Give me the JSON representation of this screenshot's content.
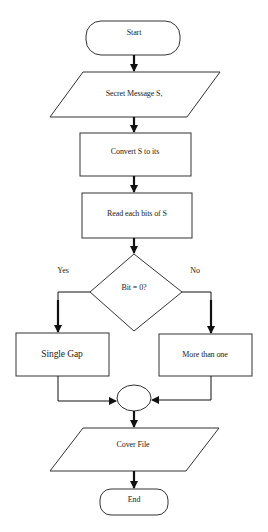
{
  "diagram": {
    "type": "flowchart",
    "colors": {
      "stroke": "#333333",
      "arrow": "#111111",
      "fill": "#ffffff",
      "text": "#222222"
    },
    "nodes": {
      "start": {
        "shape": "terminal",
        "label": "Start"
      },
      "input_message": {
        "shape": "parallelogram",
        "label": "Secret Message S,"
      },
      "convert": {
        "shape": "process",
        "label": "Convert S to its"
      },
      "read_bits": {
        "shape": "process",
        "label": "Read each bits of S"
      },
      "decision": {
        "shape": "decision",
        "label": "Bit = 0?"
      },
      "single_gap": {
        "shape": "process",
        "label": "Single Gap"
      },
      "more_than_one": {
        "shape": "process",
        "label": "More than one"
      },
      "merge": {
        "shape": "connector",
        "label": ""
      },
      "cover_file": {
        "shape": "parallelogram",
        "label": "Cover File"
      },
      "end": {
        "shape": "terminal",
        "label": "End"
      }
    },
    "branches": {
      "yes": "Yes",
      "no": "No"
    },
    "edges": [
      {
        "from": "start",
        "to": "input_message"
      },
      {
        "from": "input_message",
        "to": "convert"
      },
      {
        "from": "convert",
        "to": "read_bits"
      },
      {
        "from": "read_bits",
        "to": "decision"
      },
      {
        "from": "decision",
        "to": "single_gap",
        "label": "Yes"
      },
      {
        "from": "decision",
        "to": "more_than_one",
        "label": "No"
      },
      {
        "from": "single_gap",
        "to": "merge"
      },
      {
        "from": "more_than_one",
        "to": "merge"
      },
      {
        "from": "merge",
        "to": "cover_file"
      },
      {
        "from": "cover_file",
        "to": "end"
      }
    ]
  }
}
